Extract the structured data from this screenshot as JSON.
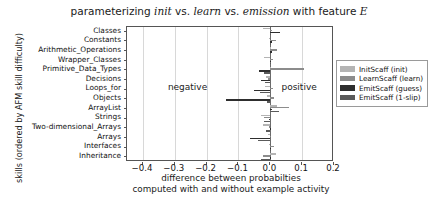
{
  "chart_data": {
    "type": "bar",
    "orientation": "horizontal",
    "title": "parameterizing init vs. learn vs. emission with feature E",
    "title_parts": {
      "p1": "parameterizing ",
      "it1": "init",
      "p2": " vs. ",
      "it2": "learn",
      "p3": " vs. ",
      "it3": "emission",
      "p4": " with feature ",
      "mathE": "E"
    },
    "xlabel_line1": "difference between probabilties",
    "xlabel_line2": "computed with and without example activity",
    "ylabel": "skills (ordered by AFM skill difficulty)",
    "xlim": [
      -0.45,
      0.2
    ],
    "xticks": [
      -0.4,
      -0.3,
      -0.2,
      -0.1,
      0.0,
      0.1,
      0.2
    ],
    "xticklabels": [
      "−0.4",
      "−0.3",
      "−0.2",
      "−0.1",
      "0.0",
      "0.1",
      "0.2"
    ],
    "grid": true,
    "grid_axis": "x",
    "legend_position": "right-outside-upper",
    "annotations": [
      {
        "text": "negative",
        "x": -0.24,
        "y_row": 6
      },
      {
        "text": "positive",
        "x": 0.035,
        "y_row": 6
      }
    ],
    "categories": [
      "Classes",
      "Constants",
      "Arithmetic_Operations",
      "Wrapper_Classes",
      "Primitive_Data_Types",
      "Decisions",
      "Loops_for",
      "Objects",
      "ArrayList",
      "Strings",
      "Two-dimensional_Arrays",
      "Arrays",
      "Interfaces",
      "Inheritance"
    ],
    "series": [
      {
        "name": "InitScaff (init)",
        "color": "#b4b4b4",
        "values": [
          -0.022,
          -0.003,
          -0.002,
          -0.02,
          -0.002,
          -0.013,
          -0.018,
          -0.01,
          0.022,
          -0.03,
          -0.022,
          -0.008,
          -0.004,
          0.018
        ]
      },
      {
        "name": "LearnScaff (learn)",
        "color": "#8c8c8c",
        "values": [
          0.004,
          0.018,
          0.022,
          0.009,
          0.105,
          -0.006,
          0.01,
          0.012,
          0.06,
          -0.02,
          -0.004,
          -0.002,
          0.013,
          -0.024
        ]
      },
      {
        "name": "EmitScaff (guess)",
        "color": "#2e2e2e",
        "values": [
          0.032,
          0.004,
          0.006,
          0.003,
          -0.035,
          -0.028,
          -0.05,
          -0.14,
          0.004,
          -0.003,
          0.002,
          -0.064,
          0.001,
          0.003
        ]
      },
      {
        "name": "EmitScaff (1-slip)",
        "color": "#5a5a5a",
        "values": [
          -0.001,
          -0.001,
          0.003,
          -0.001,
          -0.02,
          -0.016,
          -0.033,
          -0.009,
          0.026,
          -0.019,
          -0.015,
          -0.04,
          -0.001,
          -0.029
        ]
      }
    ]
  },
  "legend": {
    "items": [
      {
        "label": "InitScaff (init)",
        "color": "#b4b4b4"
      },
      {
        "label": "LearnScaff (learn)",
        "color": "#8c8c8c"
      },
      {
        "label": "EmitScaff (guess)",
        "color": "#2e2e2e"
      },
      {
        "label": "EmitScaff (1-slip)",
        "color": "#5a5a5a"
      }
    ]
  }
}
